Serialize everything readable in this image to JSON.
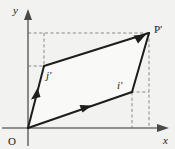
{
  "figure": {
    "background_color": "#f2f2f0",
    "line_color": "#1d1d1d",
    "axis_color": "#6f6f6f",
    "dash_color": "#8a8a8a"
  },
  "axes": {
    "x_label": "x",
    "y_label": "y",
    "origin_label": "O",
    "x_axis_y_pixel": 128,
    "y_axis_x_pixel": 28
  },
  "points": {
    "origin": {
      "label": "O",
      "x": 28,
      "y": 128
    },
    "j_prime": {
      "label": "j",
      "prime": "′",
      "x": 44,
      "y": 66
    },
    "i_prime": {
      "label": "i",
      "prime": "′",
      "x": 132,
      "y": 92
    },
    "p_prime": {
      "label": "P",
      "prime": "′",
      "x": 149,
      "y": 33
    }
  },
  "edges": [
    {
      "name": "origin-to-j-prime",
      "from": "origin",
      "to": "j_prime",
      "arrow": true
    },
    {
      "name": "origin-to-i-prime",
      "from": "origin",
      "to": "i_prime",
      "arrow": true
    },
    {
      "name": "j-prime-to-p-prime",
      "from": "j_prime",
      "to": "p_prime",
      "arrow": true
    },
    {
      "name": "i-prime-to-p-prime",
      "from": "i_prime",
      "to": "p_prime",
      "arrow": false
    }
  ],
  "guides": [
    {
      "name": "horizontal-guide-at-p-prime",
      "orientation": "horizontal",
      "from_x": 28,
      "to_x": 149,
      "y": 33
    },
    {
      "name": "vertical-guide-from-j-prime",
      "orientation": "vertical",
      "x": 44,
      "from_y": 33,
      "to_y": 66
    },
    {
      "name": "horizontal-guide-at-j-prime",
      "orientation": "horizontal",
      "from_x": 28,
      "to_x": 44,
      "y": 66
    },
    {
      "name": "horizontal-guide-at-i-prime",
      "orientation": "horizontal",
      "from_x": 132,
      "to_x": 149,
      "y": 92
    },
    {
      "name": "vertical-guide-from-i-prime",
      "orientation": "vertical",
      "x": 132,
      "from_y": 92,
      "to_y": 128
    },
    {
      "name": "vertical-guide-from-p-prime",
      "orientation": "vertical",
      "x": 149,
      "from_y": 33,
      "to_y": 128
    }
  ],
  "labels": {
    "y_axis": "y",
    "x_axis": "x",
    "origin": "O",
    "j_prime": "j′",
    "i_prime": "i′",
    "p_prime": "P′"
  }
}
